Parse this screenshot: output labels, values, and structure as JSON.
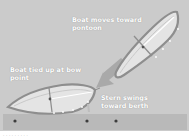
{
  "diagram": {
    "labels": {
      "moving": "Boat moves toward pontoon",
      "moving_line1": "Boat moves toward",
      "moving_line2": "pontoon",
      "tied": "Boat tied up at bow point",
      "tied_line1": "Boat tied up at bow",
      "tied_line2": "point",
      "stern": "Stern swings toward berth",
      "stern_line1": "Stern swings",
      "stern_line2": "toward berth"
    },
    "caption": "· · · · · · · · ·"
  },
  "colors": {
    "background": "#cbcbcb",
    "pontoon": "#b9b9b9",
    "hull_outline": "#8f8f8f",
    "hull_fill": "#e6e6e6",
    "arrow": "#a8a8a8",
    "label": "#ffffff",
    "cleat": "#444444"
  },
  "elements": {
    "boats": [
      {
        "name": "approaching-boat",
        "state": "moving"
      },
      {
        "name": "moored-boat",
        "state": "tied-at-bow"
      }
    ],
    "cleats": 3
  }
}
